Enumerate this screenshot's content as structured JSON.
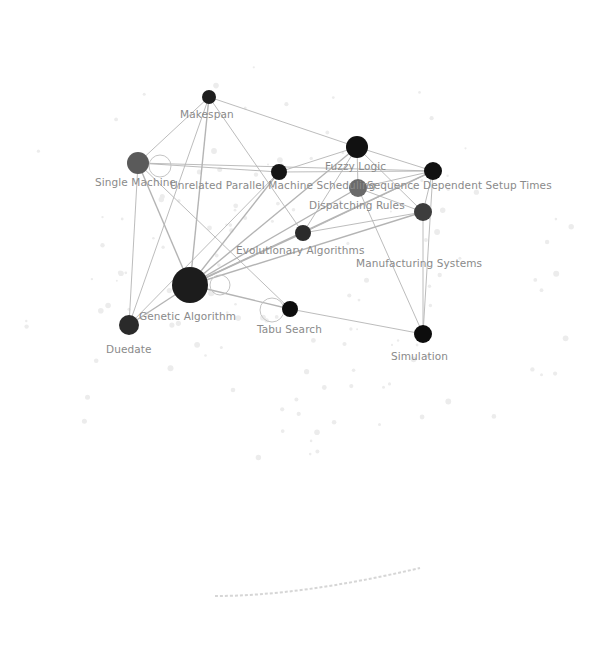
{
  "diagram": {
    "type": "co-word keyword network",
    "nodes": [
      {
        "id": "makespan",
        "label": "Makespan",
        "x": 209,
        "y": 97,
        "r": 7,
        "fill": "#1f1f1f",
        "lx": 180,
        "ly": 109
      },
      {
        "id": "single-machine",
        "label": "Single Machine",
        "x": 138,
        "y": 163,
        "r": 11,
        "fill": "#5a5a5a",
        "lx": 95,
        "ly": 177
      },
      {
        "id": "unrelated-parallel-machine",
        "label": "Unrelated Parallel Machine Scheduling",
        "x": 279,
        "y": 172,
        "r": 8,
        "fill": "#151515",
        "lx": 170,
        "ly": 180
      },
      {
        "id": "fuzzy-logic",
        "label": "Fuzzy Logic",
        "x": 357,
        "y": 147,
        "r": 11,
        "fill": "#111111",
        "lx": 325,
        "ly": 161
      },
      {
        "id": "sequence-dependent-setup-times",
        "label": "Sequence Dependent Setup Times",
        "x": 433,
        "y": 171,
        "r": 9,
        "fill": "#111111",
        "lx": 367,
        "ly": 180
      },
      {
        "id": "dispatching-rules",
        "label": "Dispatching Rules",
        "x": 358,
        "y": 188,
        "r": 9,
        "fill": "#6a6a6a",
        "lx": 309,
        "ly": 200
      },
      {
        "id": "evolutionary-algorithms",
        "label": "Evolutionary Algorithms",
        "x": 303,
        "y": 233,
        "r": 8,
        "fill": "#2b2b2b",
        "lx": 236,
        "ly": 245
      },
      {
        "id": "manufacturing-systems",
        "label": "Manufacturing Systems",
        "x": 423,
        "y": 212,
        "r": 9,
        "fill": "#3d3d3d",
        "lx": 356,
        "ly": 258
      },
      {
        "id": "genetic-algorithm",
        "label": "Genetic Algorithm",
        "x": 190,
        "y": 285,
        "r": 18,
        "fill": "#1c1c1c",
        "lx": 139,
        "ly": 311
      },
      {
        "id": "tabu-search",
        "label": "Tabu Search",
        "x": 290,
        "y": 309,
        "r": 8,
        "fill": "#0d0d0d",
        "lx": 257,
        "ly": 324
      },
      {
        "id": "duedate",
        "label": "Duedate",
        "x": 129,
        "y": 325,
        "r": 10,
        "fill": "#2a2a2a",
        "lx": 106,
        "ly": 344
      },
      {
        "id": "simulation",
        "label": "Simulation",
        "x": 423,
        "y": 334,
        "r": 9,
        "fill": "#0d0d0d",
        "lx": 391,
        "ly": 351
      }
    ],
    "edges": [
      [
        "makespan",
        "single-machine"
      ],
      [
        "makespan",
        "fuzzy-logic"
      ],
      [
        "makespan",
        "genetic-algorithm"
      ],
      [
        "makespan",
        "evolutionary-algorithms"
      ],
      [
        "makespan",
        "duedate"
      ],
      [
        "single-machine",
        "unrelated-parallel-machine"
      ],
      [
        "single-machine",
        "genetic-algorithm"
      ],
      [
        "single-machine",
        "duedate"
      ],
      [
        "single-machine",
        "tabu-search"
      ],
      [
        "single-machine",
        "sequence-dependent-setup-times"
      ],
      [
        "unrelated-parallel-machine",
        "fuzzy-logic"
      ],
      [
        "unrelated-parallel-machine",
        "genetic-algorithm"
      ],
      [
        "unrelated-parallel-machine",
        "sequence-dependent-setup-times"
      ],
      [
        "unrelated-parallel-machine",
        "duedate"
      ],
      [
        "fuzzy-logic",
        "sequence-dependent-setup-times"
      ],
      [
        "fuzzy-logic",
        "dispatching-rules"
      ],
      [
        "fuzzy-logic",
        "evolutionary-algorithms"
      ],
      [
        "fuzzy-logic",
        "manufacturing-systems"
      ],
      [
        "fuzzy-logic",
        "genetic-algorithm"
      ],
      [
        "sequence-dependent-setup-times",
        "manufacturing-systems"
      ],
      [
        "sequence-dependent-setup-times",
        "genetic-algorithm"
      ],
      [
        "sequence-dependent-setup-times",
        "dispatching-rules"
      ],
      [
        "sequence-dependent-setup-times",
        "evolutionary-algorithms"
      ],
      [
        "dispatching-rules",
        "manufacturing-systems"
      ],
      [
        "dispatching-rules",
        "simulation"
      ],
      [
        "dispatching-rules",
        "genetic-algorithm"
      ],
      [
        "evolutionary-algorithms",
        "genetic-algorithm"
      ],
      [
        "evolutionary-algorithms",
        "manufacturing-systems"
      ],
      [
        "manufacturing-systems",
        "simulation"
      ],
      [
        "manufacturing-systems",
        "genetic-algorithm"
      ],
      [
        "genetic-algorithm",
        "tabu-search"
      ],
      [
        "genetic-algorithm",
        "duedate"
      ],
      [
        "tabu-search",
        "simulation"
      ],
      [
        "sequence-dependent-setup-times",
        "simulation"
      ]
    ],
    "ring_markers": [
      {
        "x": 160,
        "y": 166,
        "r": 11
      },
      {
        "x": 220,
        "y": 285,
        "r": 10
      },
      {
        "x": 272,
        "y": 310,
        "r": 12
      }
    ]
  },
  "caption": {
    "text": ""
  }
}
